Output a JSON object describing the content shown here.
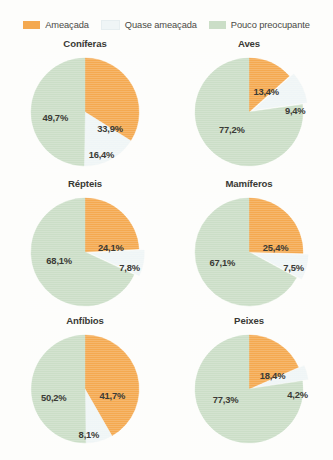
{
  "legend": {
    "items": [
      {
        "label": "Ameaçada",
        "color": "#f4a950",
        "icon": "legend-swatch-icon"
      },
      {
        "label": "Quase ameaçada",
        "color": "#eff5f6",
        "icon": "legend-swatch-icon"
      },
      {
        "label": "Pouco preocupante",
        "color": "#cbdec7",
        "icon": "legend-swatch-icon"
      }
    ]
  },
  "chart_data": [
    {
      "type": "pie",
      "title": "Coníferas",
      "categories": [
        "Ameaçada",
        "Quase ameaçada",
        "Pouco preocupante"
      ],
      "values": [
        33.9,
        16.4,
        49.7
      ],
      "labels": [
        "33,9%",
        "16,4%",
        "49,7%"
      ],
      "colors": [
        "#f4a950",
        "#eff5f6",
        "#cbdec7"
      ],
      "label_positions": [
        [
          0.32,
          0.3
        ],
        [
          0.21,
          0.78
        ],
        [
          -0.38,
          0.1
        ]
      ],
      "explode": [
        0,
        0,
        0
      ]
    },
    {
      "type": "pie",
      "title": "Aves",
      "categories": [
        "Ameaçada",
        "Quase ameaçada",
        "Pouco preocupante"
      ],
      "values": [
        13.4,
        9.4,
        77.2
      ],
      "labels": [
        "13,4%",
        "9,4%",
        "77,2%"
      ],
      "colors": [
        "#f4a950",
        "#eff5f6",
        "#cbdec7"
      ],
      "label_positions": [
        [
          0.22,
          -0.39
        ],
        [
          0.59,
          -0.03
        ],
        [
          -0.22,
          0.32
        ]
      ],
      "explode": [
        0,
        0.09,
        0
      ]
    },
    {
      "type": "pie",
      "title": "Répteis",
      "categories": [
        "Ameaçada",
        "Quase ameaçada",
        "Pouco preocupante"
      ],
      "values": [
        24.1,
        7.8,
        68.1
      ],
      "labels": [
        "24,1%",
        "7,8%",
        "68,1%"
      ],
      "colors": [
        "#f4a950",
        "#eff5f6",
        "#cbdec7"
      ],
      "label_positions": [
        [
          0.33,
          -0.1
        ],
        [
          0.57,
          0.27
        ],
        [
          -0.33,
          0.14
        ]
      ],
      "explode": [
        0,
        0.1,
        0
      ]
    },
    {
      "type": "pie",
      "title": "Mamíferos",
      "categories": [
        "Ameaçada",
        "Quase ameaçada",
        "Pouco preocupante"
      ],
      "values": [
        25.4,
        7.5,
        67.1
      ],
      "labels": [
        "25,4%",
        "7,5%",
        "67,1%"
      ],
      "colors": [
        "#f4a950",
        "#eff5f6",
        "#cbdec7"
      ],
      "label_positions": [
        [
          0.34,
          -0.1
        ],
        [
          0.57,
          0.27
        ],
        [
          -0.34,
          0.18
        ]
      ],
      "explode": [
        0,
        0.1,
        0
      ]
    },
    {
      "type": "pie",
      "title": "Anfíbios",
      "categories": [
        "Ameaçada",
        "Quase ameaçada",
        "Pouco preocupante"
      ],
      "values": [
        41.7,
        8.1,
        50.2
      ],
      "labels": [
        "41,7%",
        "8,1%",
        "50,2%"
      ],
      "colors": [
        "#f4a950",
        "#eff5f6",
        "#cbdec7"
      ],
      "label_positions": [
        [
          0.35,
          0.12
        ],
        [
          0.05,
          0.83
        ],
        [
          -0.4,
          0.14
        ]
      ],
      "explode": [
        0,
        0,
        0
      ]
    },
    {
      "type": "pie",
      "title": "Peixes",
      "categories": [
        "Ameaçada",
        "Quase ameaçada",
        "Pouco preocupante"
      ],
      "values": [
        18.4,
        4.2,
        77.3
      ],
      "labels": [
        "18,4%",
        "4,2%",
        "77,3%"
      ],
      "colors": [
        "#f4a950",
        "#eff5f6",
        "#cbdec7"
      ],
      "label_positions": [
        [
          0.3,
          -0.26
        ],
        [
          0.62,
          0.1
        ],
        [
          -0.3,
          0.18
        ]
      ],
      "explode": [
        0,
        0.11,
        0
      ]
    }
  ]
}
